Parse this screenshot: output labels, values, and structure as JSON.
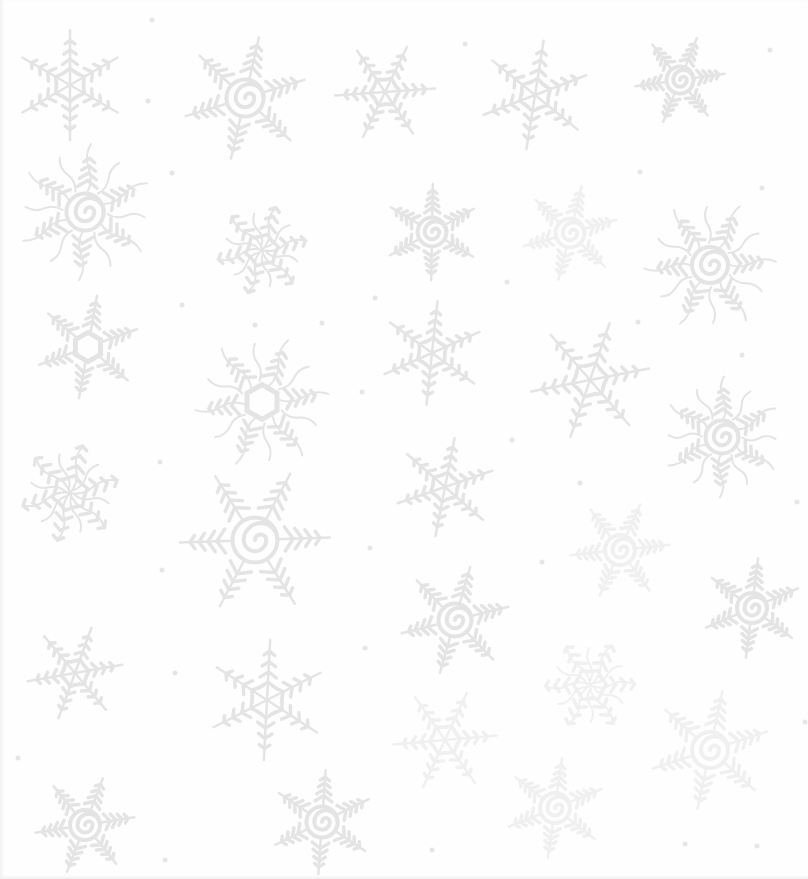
{
  "pattern": {
    "background": "#fefefe",
    "ink": "#e4e4e4",
    "ink_light": "#ececec",
    "flakes": [
      {
        "x": 70,
        "y": 85,
        "r": 55,
        "type": "star"
      },
      {
        "x": 245,
        "y": 98,
        "r": 62,
        "type": "spiral"
      },
      {
        "x": 385,
        "y": 92,
        "r": 50,
        "type": "star"
      },
      {
        "x": 535,
        "y": 95,
        "r": 55,
        "type": "star"
      },
      {
        "x": 680,
        "y": 80,
        "r": 45,
        "type": "spiral"
      },
      {
        "x": 85,
        "y": 212,
        "r": 62,
        "type": "wavy-spiral"
      },
      {
        "x": 262,
        "y": 250,
        "r": 55,
        "type": "wavy"
      },
      {
        "x": 432,
        "y": 232,
        "r": 48,
        "type": "spiral"
      },
      {
        "x": 570,
        "y": 233,
        "r": 48,
        "type": "spiral",
        "faint": true
      },
      {
        "x": 710,
        "y": 265,
        "r": 60,
        "type": "wavy-spiral"
      },
      {
        "x": 88,
        "y": 347,
        "r": 52,
        "type": "hex"
      },
      {
        "x": 262,
        "y": 402,
        "r": 62,
        "type": "wavy-hex"
      },
      {
        "x": 432,
        "y": 353,
        "r": 52,
        "type": "star"
      },
      {
        "x": 590,
        "y": 380,
        "r": 60,
        "type": "star"
      },
      {
        "x": 722,
        "y": 437,
        "r": 55,
        "type": "wavy-spiral"
      },
      {
        "x": 70,
        "y": 493,
        "r": 60,
        "type": "wavy"
      },
      {
        "x": 255,
        "y": 540,
        "r": 75,
        "type": "spiral"
      },
      {
        "x": 445,
        "y": 487,
        "r": 50,
        "type": "star"
      },
      {
        "x": 620,
        "y": 550,
        "r": 50,
        "type": "spiral",
        "faint": true
      },
      {
        "x": 752,
        "y": 608,
        "r": 50,
        "type": "spiral"
      },
      {
        "x": 75,
        "y": 673,
        "r": 48,
        "type": "star"
      },
      {
        "x": 267,
        "y": 700,
        "r": 60,
        "type": "star"
      },
      {
        "x": 455,
        "y": 620,
        "r": 55,
        "type": "spiral"
      },
      {
        "x": 590,
        "y": 685,
        "r": 55,
        "type": "wavy",
        "faint": true
      },
      {
        "x": 710,
        "y": 750,
        "r": 60,
        "type": "spiral",
        "faint": true
      },
      {
        "x": 445,
        "y": 740,
        "r": 52,
        "type": "star",
        "faint": true
      },
      {
        "x": 555,
        "y": 808,
        "r": 50,
        "type": "spiral",
        "faint": true
      },
      {
        "x": 85,
        "y": 825,
        "r": 50,
        "type": "spiral"
      },
      {
        "x": 322,
        "y": 822,
        "r": 52,
        "type": "spiral"
      }
    ],
    "dots": [
      [
        152,
        20
      ],
      [
        465,
        44
      ],
      [
        770,
        50
      ],
      [
        148,
        101
      ],
      [
        172,
        173
      ],
      [
        640,
        172
      ],
      [
        762,
        188
      ],
      [
        182,
        305
      ],
      [
        375,
        298
      ],
      [
        507,
        282
      ],
      [
        255,
        325
      ],
      [
        322,
        323
      ],
      [
        362,
        392
      ],
      [
        512,
        440
      ],
      [
        160,
        462
      ],
      [
        580,
        483
      ],
      [
        797,
        502
      ],
      [
        742,
        355
      ],
      [
        370,
        548
      ],
      [
        162,
        570
      ],
      [
        542,
        562
      ],
      [
        365,
        648
      ],
      [
        175,
        673
      ],
      [
        18,
        758
      ],
      [
        165,
        860
      ],
      [
        432,
        850
      ],
      [
        685,
        844
      ],
      [
        757,
        846
      ],
      [
        805,
        722
      ],
      [
        638,
        322
      ]
    ]
  }
}
